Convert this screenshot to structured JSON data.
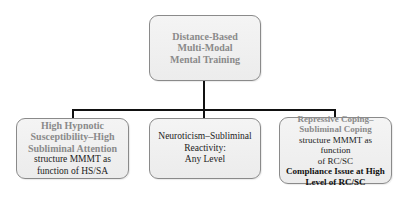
{
  "diagram": {
    "root": {
      "lines": [
        "Distance-Based",
        "Multi-Modal",
        "Mental Training"
      ]
    },
    "children": [
      {
        "title_lines": [
          "High Hypnotic",
          "Susceptibility–High",
          "Subliminal Attention"
        ],
        "body_lines": [
          "structure MMMT as",
          "function of HS/SA"
        ]
      },
      {
        "body_lines": [
          "Neuroticism–Subliminal",
          "Reactivity:",
          "Any Level"
        ]
      },
      {
        "title_lines": [
          "Repressive Coping–",
          "Subliminal Coping"
        ],
        "body_lines": [
          "structure MMMT as function",
          "of RC/SC"
        ],
        "emphasis_lines": [
          "Compliance Issue at High",
          "Level of RC/SC"
        ]
      }
    ],
    "colors": {
      "box_fill": "#eeeeee",
      "box_border": "#8a8a8a",
      "title_text": "#8a8a8a",
      "connector": "#111111"
    }
  }
}
